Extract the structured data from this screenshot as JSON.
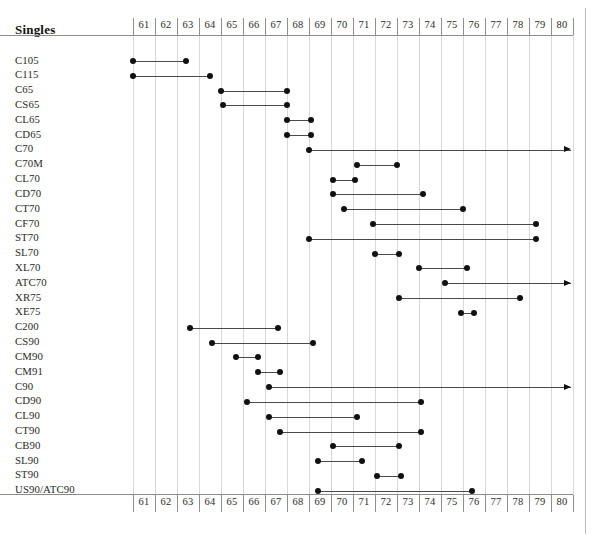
{
  "header": {
    "title": "Singles"
  },
  "chart_data": {
    "type": "bar",
    "subtype": "gantt-timeline",
    "title": "Singles",
    "xlabel": "",
    "ylabel": "",
    "xlim": [
      61,
      80
    ],
    "axis_ticks": [
      "61",
      "62",
      "63",
      "64",
      "65",
      "66",
      "67",
      "68",
      "69",
      "70",
      "71",
      "72",
      "73",
      "74",
      "75",
      "76",
      "77",
      "78",
      "79",
      "80"
    ],
    "axis_position": [
      "top",
      "bottom"
    ],
    "grid": true,
    "legend": "none",
    "categories": [
      "C105",
      "C115",
      "C65",
      "CS65",
      "CL65",
      "CD65",
      "C70",
      "C70M",
      "CL70",
      "CD70",
      "CT70",
      "CF70",
      "ST70",
      "SL70",
      "XL70",
      "ATC70",
      "XR75",
      "XE75",
      "C200",
      "CS90",
      "CM90",
      "CM91",
      "C90",
      "CD90",
      "CL90",
      "CT90",
      "CB90",
      "SL90",
      "ST90",
      "US90/ATC90"
    ],
    "series": [
      {
        "name": "C105",
        "start": 61.0,
        "end": 63.4,
        "open_ended": false
      },
      {
        "name": "C115",
        "start": 61.0,
        "end": 64.5,
        "open_ended": false
      },
      {
        "name": "C65",
        "start": 65.0,
        "end": 68.0,
        "open_ended": false
      },
      {
        "name": "CS65",
        "start": 65.1,
        "end": 68.0,
        "open_ended": false
      },
      {
        "name": "CL65",
        "start": 68.0,
        "end": 69.1,
        "open_ended": false
      },
      {
        "name": "CD65",
        "start": 68.0,
        "end": 69.1,
        "open_ended": false
      },
      {
        "name": "C70",
        "start": 69.0,
        "end": 80.9,
        "open_ended": true
      },
      {
        "name": "C70M",
        "start": 71.2,
        "end": 73.0,
        "open_ended": false
      },
      {
        "name": "CL70",
        "start": 70.1,
        "end": 71.1,
        "open_ended": false
      },
      {
        "name": "CD70",
        "start": 70.1,
        "end": 74.2,
        "open_ended": false
      },
      {
        "name": "CT70",
        "start": 70.6,
        "end": 76.0,
        "open_ended": false
      },
      {
        "name": "CF70",
        "start": 71.9,
        "end": 79.3,
        "open_ended": false
      },
      {
        "name": "ST70",
        "start": 69.0,
        "end": 79.3,
        "open_ended": false
      },
      {
        "name": "SL70",
        "start": 72.0,
        "end": 73.1,
        "open_ended": false
      },
      {
        "name": "XL70",
        "start": 74.0,
        "end": 76.2,
        "open_ended": false
      },
      {
        "name": "ATC70",
        "start": 75.2,
        "end": 80.9,
        "open_ended": true
      },
      {
        "name": "XR75",
        "start": 73.1,
        "end": 78.6,
        "open_ended": false
      },
      {
        "name": "XE75",
        "start": 75.9,
        "end": 76.5,
        "open_ended": false
      },
      {
        "name": "C200",
        "start": 63.6,
        "end": 67.6,
        "open_ended": false
      },
      {
        "name": "CS90",
        "start": 64.6,
        "end": 69.2,
        "open_ended": false
      },
      {
        "name": "CM90",
        "start": 65.7,
        "end": 66.7,
        "open_ended": false
      },
      {
        "name": "CM91",
        "start": 66.7,
        "end": 67.7,
        "open_ended": false
      },
      {
        "name": "C90",
        "start": 67.2,
        "end": 80.9,
        "open_ended": true
      },
      {
        "name": "CD90",
        "start": 66.2,
        "end": 74.1,
        "open_ended": false
      },
      {
        "name": "CL90",
        "start": 67.2,
        "end": 71.2,
        "open_ended": false
      },
      {
        "name": "CT90",
        "start": 67.7,
        "end": 74.1,
        "open_ended": false
      },
      {
        "name": "CB90",
        "start": 70.1,
        "end": 73.1,
        "open_ended": false
      },
      {
        "name": "SL90",
        "start": 69.4,
        "end": 71.4,
        "open_ended": false
      },
      {
        "name": "ST90",
        "start": 72.1,
        "end": 73.2,
        "open_ended": false
      },
      {
        "name": "US90/ATC90",
        "start": 69.4,
        "end": 76.4,
        "open_ended": false
      }
    ]
  },
  "colors": {
    "mark": "#111111",
    "line": "#4a4a4a",
    "grid": "#d8d8d8",
    "axis": "#8d8d8d",
    "text": "#2a2a2a"
  }
}
